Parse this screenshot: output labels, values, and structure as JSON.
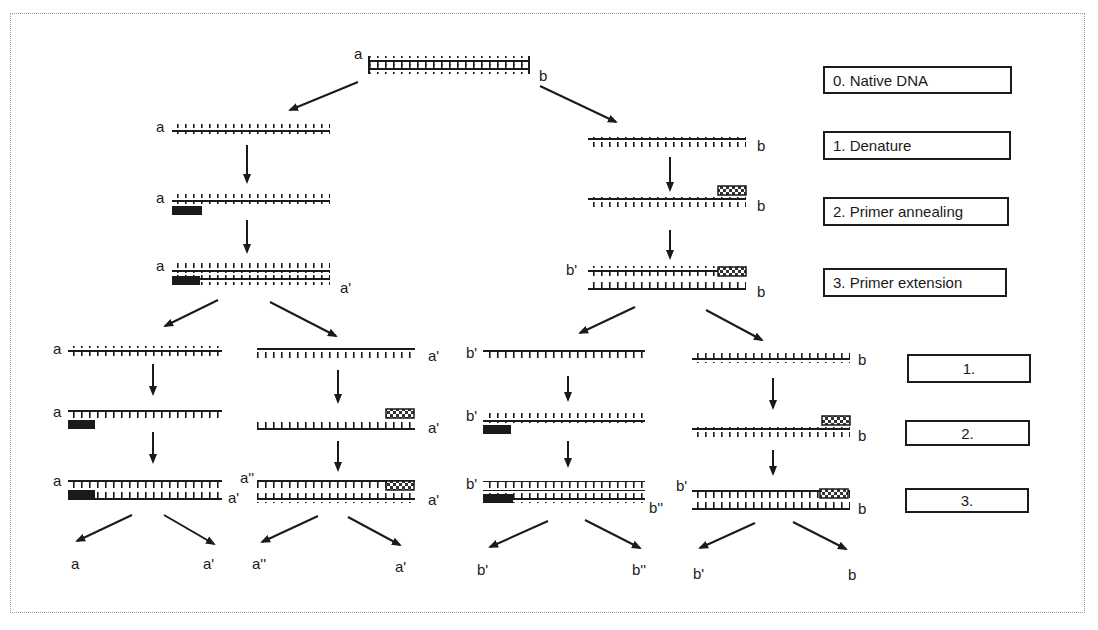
{
  "figure": {
    "colors": {
      "ink": "#1a1a1a",
      "frame": "#9a9a9a",
      "background": "#ffffff"
    }
  },
  "steps_cycle1": [
    {
      "id": "s0",
      "label": "0. Native DNA"
    },
    {
      "id": "s1",
      "label": "1. Denature"
    },
    {
      "id": "s2",
      "label": "2. Primer annealing"
    },
    {
      "id": "s3",
      "label": "3. Primer extension"
    }
  ],
  "steps_cycle2": [
    {
      "id": "c2s1",
      "label": "1."
    },
    {
      "id": "c2s2",
      "label": "2."
    },
    {
      "id": "c2s3",
      "label": "3."
    }
  ],
  "labels": {
    "native_a": "a",
    "native_b": "b",
    "l_denat_a": "a",
    "l_anneal_a": "a",
    "l_ext_a": "a",
    "l_ext_a2": "a'",
    "r_denat_b": "b",
    "r_anneal_b": "b",
    "r_ext_b1": "b'",
    "r_ext_b": "b",
    "c1_d_a": "a",
    "c1_an_a": "a",
    "c1_ex_a": "a",
    "c1_ex_a2": "a'",
    "c2_d_a": "a'",
    "c2_an_a": "a'",
    "c2_ex_a3": "a''",
    "c2_ex_a2": "a'",
    "c3_d_b": "b'",
    "c3_an_b": "b'",
    "c3_ex_b": "b'",
    "c3_ex_b2": "b''",
    "c4_d_b": "b",
    "c4_an_b": "b",
    "c4_ex_b1": "b'",
    "c4_ex_b": "b",
    "out1": "a",
    "out2": "a'",
    "out3": "a''",
    "out4": "a'",
    "out5": "b'",
    "out6": "b''",
    "out7": "b'",
    "out8": "b"
  }
}
